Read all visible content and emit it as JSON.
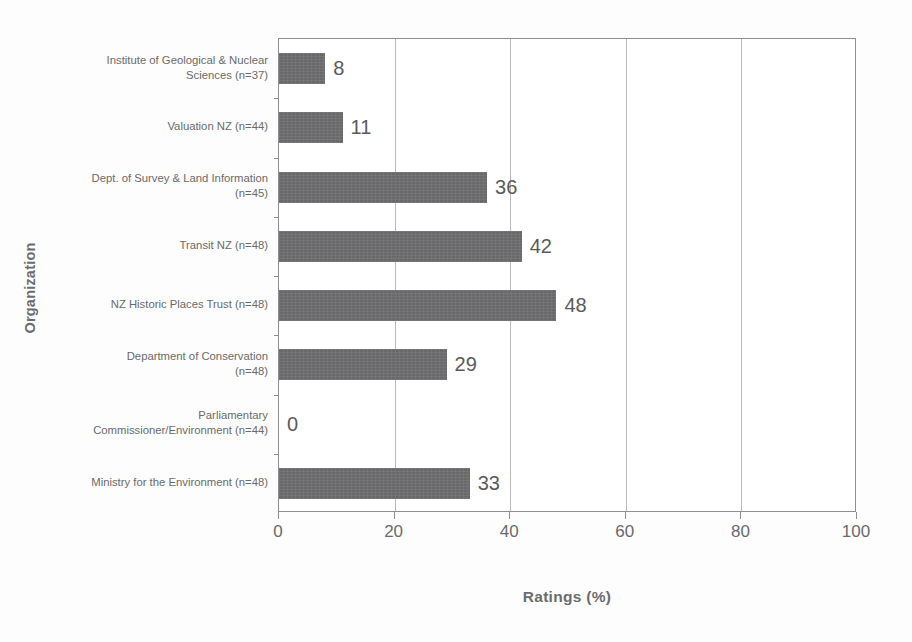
{
  "chart_data": {
    "type": "bar",
    "orientation": "horizontal",
    "title": "",
    "xlabel": "Ratings (%)",
    "ylabel": "Organization",
    "xlim": [
      0,
      100
    ],
    "xticks": [
      0,
      20,
      40,
      60,
      80,
      100
    ],
    "grid": "vertical",
    "legend": "none",
    "bar_color": "#6f6f71",
    "categories": [
      "Institute of Geological & Nuclear Sciences (n=37)",
      "Valuation NZ (n=44)",
      "Dept. of Survey & Land Information (n=45)",
      "Transit NZ (n=48)",
      "NZ Historic Places Trust (n=48)",
      "Department of Conservation (n=48)",
      "Parliamentary Commissioner/Environment (n=44)",
      "Ministry for the Environment (n=48)"
    ],
    "category_lines": [
      [
        "Institute of Geological & Nuclear",
        "Sciences (n=37)"
      ],
      [
        "Valuation NZ (n=44)"
      ],
      [
        "Dept. of Survey & Land Information",
        "(n=45)"
      ],
      [
        "Transit NZ (n=48)"
      ],
      [
        "NZ Historic Places Trust (n=48)"
      ],
      [
        "Department of Conservation",
        "(n=48)"
      ],
      [
        "Parliamentary",
        "Commissioner/Environment (n=44)"
      ],
      [
        "Ministry for the Environment (n=48)"
      ]
    ],
    "values": [
      8,
      11,
      36,
      42,
      48,
      29,
      0,
      33
    ],
    "data_labels": [
      "8",
      "11",
      "36",
      "42",
      "48",
      "29",
      "0",
      "33"
    ]
  },
  "axes": {
    "x_tick_labels": [
      "0",
      "20",
      "40",
      "60",
      "80",
      "100"
    ],
    "x_axis_title": "Ratings (%)",
    "y_axis_title": "Organization"
  },
  "artifacts": {
    "ghost_text": [
      "printed on the",
      "the and",
      "pasi the"
    ]
  }
}
